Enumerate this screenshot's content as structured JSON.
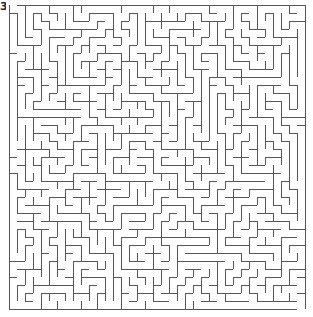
{
  "label": "3",
  "maze": {
    "cols": 37,
    "rows": 38,
    "cell": 8,
    "origin_x": 9,
    "origin_y": 5,
    "wall_color": "#555555",
    "background": "#ffffff",
    "seed": 20240517,
    "entrance": {
      "col": 0,
      "side": "top"
    },
    "exit": {
      "col": 36,
      "side": "bottom"
    }
  }
}
